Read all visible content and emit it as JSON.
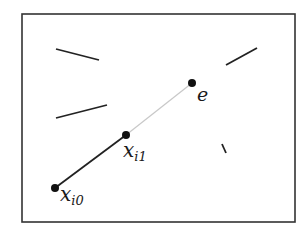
{
  "diagram": {
    "frame": {
      "x": 22,
      "y": 14,
      "width": 273,
      "height": 208,
      "stroke": "#333333"
    },
    "segments": [
      {
        "id": "edge-segment-1",
        "x1": 56,
        "y1": 49,
        "x2": 99,
        "y2": 60,
        "stroke": "#222222"
      },
      {
        "id": "edge-segment-2",
        "x1": 56,
        "y1": 118,
        "x2": 107,
        "y2": 105,
        "stroke": "#222222"
      },
      {
        "id": "edge-segment-3",
        "x1": 226,
        "y1": 65,
        "x2": 257,
        "y2": 48,
        "stroke": "#222222"
      },
      {
        "id": "edge-segment-4",
        "x1": 222,
        "y1": 144,
        "x2": 226,
        "y2": 153,
        "stroke": "#222222"
      }
    ],
    "path": {
      "solid": {
        "x1": 55,
        "y1": 188,
        "x2": 126,
        "y2": 135,
        "stroke": "#222222"
      },
      "faint": {
        "x1": 126,
        "y1": 135,
        "x2": 192,
        "y2": 83,
        "stroke": "#c8c8c8"
      }
    },
    "points": [
      {
        "name": "x_i0",
        "cx": 55,
        "cy": 188,
        "base": "x",
        "sub": "i0"
      },
      {
        "name": "x_i1",
        "cx": 126,
        "cy": 135,
        "base": "x",
        "sub": "i1"
      },
      {
        "name": "e",
        "cx": 192,
        "cy": 83,
        "base": "e",
        "sub": ""
      }
    ],
    "labels": {
      "e": "e",
      "x_i1_base": "x",
      "x_i1_sub": "i1",
      "x_i0_base": "x",
      "x_i0_sub": "i0"
    }
  }
}
